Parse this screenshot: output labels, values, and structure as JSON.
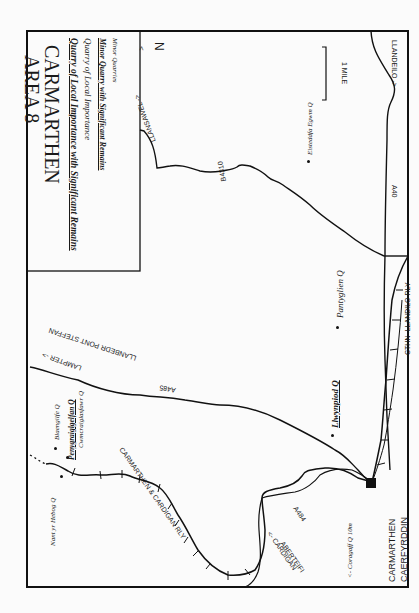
{
  "legend": {
    "title_line1": "CARMARTHEN",
    "title_line2": "AREA  8",
    "items": [
      {
        "label": "Quarry of Local Importance with Significant Remains",
        "style": "bold-italic-underline"
      },
      {
        "label": "Quarry of Local Importance",
        "style": "italic"
      },
      {
        "label": "Minor Quarry with Significant Remains",
        "style": "bold-italic-underline"
      },
      {
        "label": "Minor Quarries",
        "style": "italic-small"
      }
    ]
  },
  "north_arrow": {
    "label": "N",
    "arrow": "<"
  },
  "scale_bar": {
    "label": "1 MILE"
  },
  "towns": {
    "carmarthen": "CARMARTHEN",
    "caerfyrddin": "CAERFYRDDIN"
  },
  "roads": {
    "a40": "A40",
    "a485": "A485",
    "a484": "A484",
    "b4310": "B4310"
  },
  "directions": {
    "llandeilo": "LLANDEILO ->",
    "llansawel": "LLANSAWEL ->",
    "lampeter": "LAMPTER ->",
    "llanbedr": "LLANBEDR PONT STEFFAN",
    "cardigan": "<- CARDIGAN",
    "aberteifi": "ABERTEIFI",
    "coragaff": "<- Coragaff Q 10m"
  },
  "railways": {
    "carmarthen_cardigan": "CARMARTHEN & CARDIGAN RLY",
    "carmarthen_llandilo": "CTHN -LLANDILO RLY"
  },
  "quarries": [
    {
      "name": "Eisteddfa Egwm Q",
      "style": "italic-small"
    },
    {
      "name": "Pantyglien Q",
      "style": "italic"
    },
    {
      "name": "Llwynpiod Q",
      "style": "bold-italic-underline"
    },
    {
      "name": "Blaengilfe Q",
      "style": "italic-small"
    },
    {
      "name": "Penygraiglgelfan Q",
      "style": "bold-italic-underline"
    },
    {
      "name": "Cwmcraiglasfawr Q",
      "style": "italic-small"
    },
    {
      "name": "Nant yr Hebog Q",
      "style": "italic-small"
    }
  ],
  "colors": {
    "ink": "#111111",
    "paper": "#fbfbfb"
  }
}
